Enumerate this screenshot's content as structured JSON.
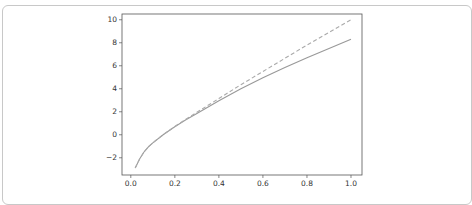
{
  "chart_data": {
    "type": "line",
    "title": "",
    "xlabel": "",
    "ylabel": "",
    "xlim": [
      -0.04,
      1.05
    ],
    "ylim": [
      -3.5,
      10.5
    ],
    "xticks": [
      0.0,
      0.2,
      0.4,
      0.6,
      0.8,
      1.0
    ],
    "xtick_labels": [
      "0.0",
      "0.2",
      "0.4",
      "0.6",
      "0.8",
      "1.0"
    ],
    "yticks": [
      -2,
      0,
      2,
      4,
      6,
      8,
      10
    ],
    "ytick_labels": [
      "−2",
      "0",
      "2",
      "4",
      "6",
      "8",
      "10"
    ],
    "grid": false,
    "legend": null,
    "series": [
      {
        "name": "solid",
        "style": "solid",
        "color": "#999999",
        "x": [
          0.02,
          0.04,
          0.06,
          0.08,
          0.1,
          0.15,
          0.2,
          0.25,
          0.3,
          0.4,
          0.5,
          0.6,
          0.7,
          0.8,
          0.9,
          1.0
        ],
        "y": [
          -2.9,
          -2.1,
          -1.5,
          -1.05,
          -0.7,
          0.05,
          0.7,
          1.3,
          1.85,
          2.95,
          4.0,
          4.95,
          5.85,
          6.7,
          7.5,
          8.3
        ]
      },
      {
        "name": "dashed",
        "style": "dashed",
        "color": "#aaaaaa",
        "x": [
          0.02,
          0.04,
          0.06,
          0.08,
          0.1,
          0.15,
          0.2,
          0.25,
          0.3,
          0.4,
          0.5,
          0.6,
          0.7,
          0.8,
          0.9,
          1.0
        ],
        "y": [
          -2.9,
          -2.1,
          -1.5,
          -1.05,
          -0.7,
          0.05,
          0.72,
          1.35,
          1.95,
          3.15,
          4.35,
          5.5,
          6.65,
          7.8,
          8.9,
          10.0
        ]
      }
    ]
  },
  "caption": ""
}
